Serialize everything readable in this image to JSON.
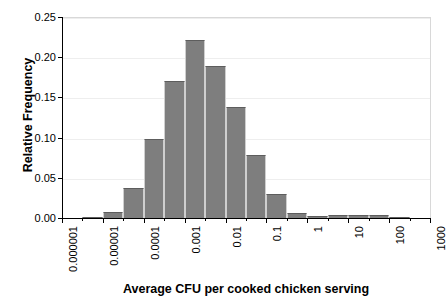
{
  "chart_data": {
    "type": "bar",
    "title": "",
    "subtitle": "",
    "xlabel": "Average CFU per cooked chicken serving",
    "ylabel": "Relative Frequency",
    "xscale": "log",
    "grid": true,
    "legend": null,
    "ylim": [
      0.0,
      0.25
    ],
    "yticks": [
      "0.00",
      "0.05",
      "0.10",
      "0.15",
      "0.20",
      "0.25"
    ],
    "ytick_values": [
      0.0,
      0.05,
      0.1,
      0.15,
      0.2,
      0.25
    ],
    "xtick_labels": [
      "0.000001",
      "0.00001",
      "0.0001",
      "0.001",
      "0.01",
      "0.1",
      "1",
      "10",
      "100",
      "1000"
    ],
    "xtick_values": [
      1e-06,
      1e-05,
      0.0001,
      0.001,
      0.01,
      0.1,
      1,
      10,
      100,
      1000
    ],
    "bin_edges": [
      1e-06,
      3.16e-06,
      1e-05,
      3.16e-05,
      0.0001,
      0.000316,
      0.001,
      0.00316,
      0.01,
      0.0316,
      0.1,
      0.316,
      1,
      3.16,
      10,
      31.6,
      100,
      316,
      1000
    ],
    "categories": [
      "1e-6–3e-6",
      "3e-6–1e-5",
      "1e-5–3e-5",
      "3e-5–1e-4",
      "1e-4–3e-4",
      "3e-4–1e-3",
      "1e-3–3e-3",
      "3e-3–1e-2",
      "1e-2–3e-2",
      "3e-2–1e-1",
      "1e-1–3e-1",
      "3e-1–1",
      "1–3",
      "3–10",
      "10–30",
      "30–100",
      "100–300",
      "300–1000"
    ],
    "values": [
      0.0,
      0.002,
      0.009,
      0.039,
      0.1,
      0.172,
      0.223,
      0.19,
      0.139,
      0.079,
      0.031,
      0.008,
      0.004,
      0.005,
      0.005,
      0.005,
      0.003,
      0.001
    ],
    "bar_color": "#7e7e7e",
    "bar_edge_color": "#5d5d5d",
    "grid_color": "#eeeeee",
    "axis_color": "#000000"
  }
}
